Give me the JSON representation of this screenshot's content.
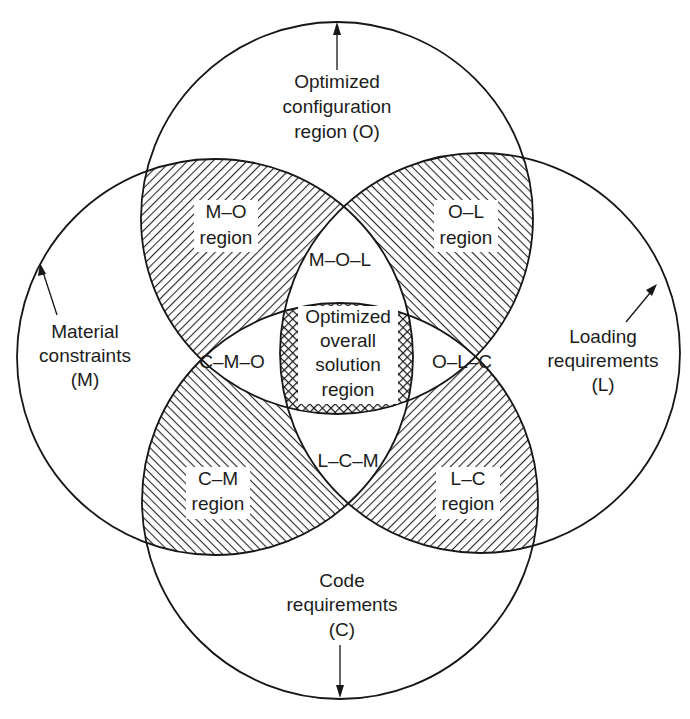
{
  "diagram": {
    "type": "four-circle venn diagram",
    "colors": {
      "line": "#161616",
      "background": "#ffffff",
      "hatch": "#2a2a2a"
    },
    "circles": {
      "O": {
        "label_lines": [
          "Optimized",
          "configuration",
          "region (O)"
        ]
      },
      "M": {
        "label_lines": [
          "Material",
          "constraints",
          "(M)"
        ]
      },
      "L": {
        "label_lines": [
          "Loading",
          "requirements",
          "(L)"
        ]
      },
      "C": {
        "label_lines": [
          "Code",
          "requirements",
          "(C)"
        ]
      }
    },
    "pair_regions": {
      "MO": [
        "M–O",
        "region"
      ],
      "OL": [
        "O–L",
        "region"
      ],
      "CM": [
        "C–M",
        "region"
      ],
      "LC": [
        "L–C",
        "region"
      ]
    },
    "triple_regions": {
      "MOL": "M–O–L",
      "CMO": "C–M–O",
      "OLC": "O–L–C",
      "LCM": "L–C–M"
    },
    "center_region": [
      "Optimized",
      "overall",
      "solution",
      "region"
    ]
  }
}
